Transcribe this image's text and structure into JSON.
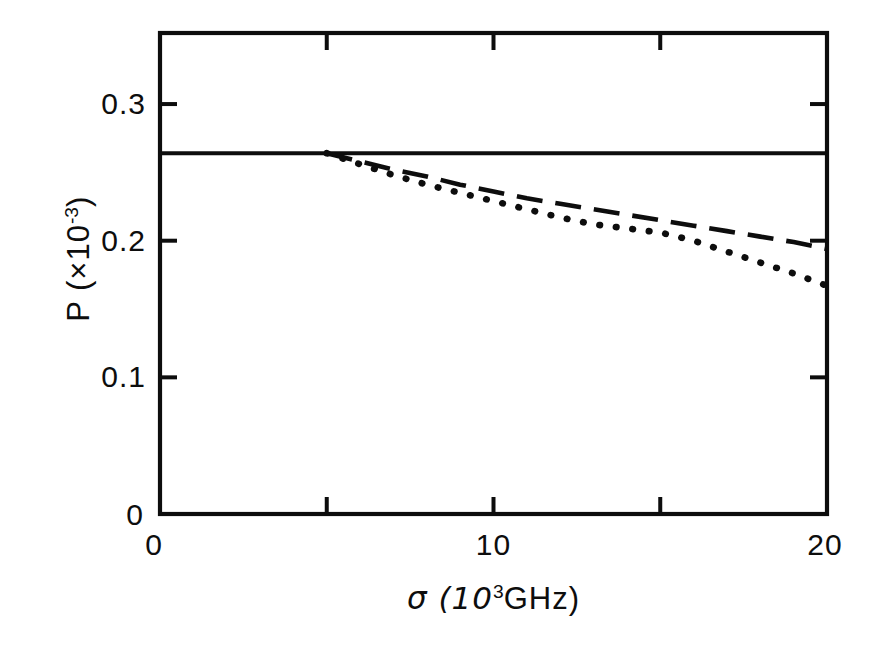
{
  "figure": {
    "background_color": "#ffffff",
    "ink_color": "#0d0d0d"
  },
  "axes": {
    "y_label_main": "P (×10",
    "y_label_exponent": "-3",
    "y_label_close": ")",
    "x_label_lead": "σ (10",
    "x_label_exponent": "3",
    "x_label_tail": "GHz)",
    "y_ticks": [
      {
        "value": 0,
        "label": "0"
      },
      {
        "value": 0.1,
        "label": "0.1"
      },
      {
        "value": 0.2,
        "label": "0.2"
      },
      {
        "value": 0.3,
        "label": "0.3"
      }
    ],
    "x_ticks": [
      {
        "value": 0,
        "label": "0"
      },
      {
        "value": 5,
        "label": ""
      },
      {
        "value": 10,
        "label": "10"
      },
      {
        "value": 15,
        "label": ""
      },
      {
        "value": 20,
        "label": "20"
      }
    ]
  },
  "chart_data": {
    "type": "line",
    "title": "",
    "xlabel": "σ (10³ GHz)",
    "ylabel": "P (×10⁻³)",
    "xlim": [
      0,
      20
    ],
    "ylim": [
      0,
      0.352
    ],
    "grid": false,
    "legend": "none",
    "x_tick_values": [
      0,
      5,
      10,
      15,
      20
    ],
    "y_tick_values": [
      0,
      0.1,
      0.2,
      0.3
    ],
    "series": [
      {
        "name": "solid",
        "style": "solid",
        "x": [
          0,
          5,
          10,
          15,
          20
        ],
        "values": [
          0.264,
          0.264,
          0.264,
          0.264,
          0.264
        ]
      },
      {
        "name": "dashed",
        "style": "dashed",
        "x": [
          5,
          6,
          7,
          8,
          9,
          10,
          11,
          12,
          13,
          14,
          15,
          16,
          17,
          18,
          19,
          20
        ],
        "values": [
          0.264,
          0.258,
          0.252,
          0.247,
          0.241,
          0.236,
          0.231,
          0.227,
          0.223,
          0.219,
          0.215,
          0.211,
          0.207,
          0.203,
          0.199,
          0.194
        ]
      },
      {
        "name": "dotted",
        "style": "dotted",
        "x": [
          5,
          6,
          7,
          8,
          9,
          10,
          11,
          12,
          13,
          14,
          15,
          16,
          17,
          18,
          19,
          20
        ],
        "values": [
          0.264,
          0.256,
          0.248,
          0.241,
          0.235,
          0.229,
          0.223,
          0.217,
          0.212,
          0.209,
          0.206,
          0.2,
          0.192,
          0.184,
          0.176,
          0.167
        ]
      }
    ]
  },
  "geometry": {
    "left": 160,
    "right": 827,
    "top": 33,
    "bottom": 514
  }
}
